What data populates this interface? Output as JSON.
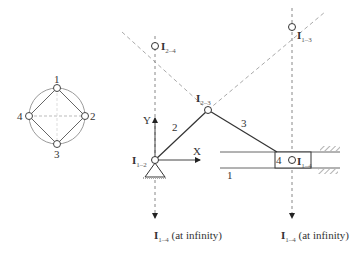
{
  "figure": {
    "type": "instant-centers-slider-crank",
    "circle_diagram": {
      "nodes": [
        {
          "id": "1",
          "label": "1"
        },
        {
          "id": "2",
          "label": "2"
        },
        {
          "id": "3",
          "label": "3"
        },
        {
          "id": "4",
          "label": "4"
        }
      ],
      "solid_edges": [
        "1-2",
        "2-3",
        "3-4",
        "4-1"
      ],
      "dashed_edges": [
        "1-3",
        "2-4"
      ]
    },
    "mechanism": {
      "link_labels": {
        "ground": "1",
        "crank": "2",
        "coupler": "3",
        "slider": "4"
      },
      "axes": {
        "x_label": "X",
        "y_label": "Y"
      },
      "instant_centers": [
        {
          "id": "I12",
          "main": "I",
          "sub": "1–2"
        },
        {
          "id": "I23",
          "main": "I",
          "sub": "2–3"
        },
        {
          "id": "I24",
          "main": "I",
          "sub": "2–4"
        },
        {
          "id": "I13",
          "main": "I",
          "sub": "1–3"
        },
        {
          "id": "I14",
          "main": "I",
          "sub": "1–4"
        }
      ],
      "infinity_labels": [
        {
          "main": "I",
          "sub": "1–4",
          "suffix": " (at infinity)"
        },
        {
          "main": "I",
          "sub": "1–4",
          "suffix": " (at infinity)"
        }
      ]
    },
    "colors": {
      "line": "#444444",
      "dashed": "#9a9a9a",
      "circle": "#999999"
    }
  }
}
